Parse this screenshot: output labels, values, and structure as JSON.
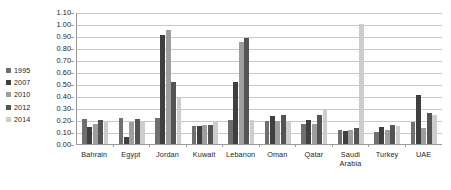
{
  "chart_data": {
    "type": "bar",
    "title": "",
    "subtitle": "",
    "xlabel": "",
    "ylabel": "",
    "ylim": [
      0.0,
      1.1
    ],
    "ytick_step": 0.1,
    "ytick_labels": [
      "1.10",
      "1.00",
      "0.90",
      "0.80",
      "0.70",
      "0.60",
      "0.50",
      "0.40",
      "0.30",
      "0.20",
      "0.10",
      "0.00"
    ],
    "ytick_values": [
      1.1,
      1.0,
      0.9,
      0.8,
      0.7,
      0.6,
      0.5,
      0.4,
      0.3,
      0.2,
      0.1,
      0.0
    ],
    "grid": true,
    "grid_axis": "y",
    "legend_position": "left",
    "categories": [
      "Bahrain",
      "Egypt",
      "Jordan",
      "Kuwait",
      "Lebanon",
      "Oman",
      "Qatar",
      "Saudi Arabia",
      "Turkey",
      "UAE"
    ],
    "series": [
      {
        "name": "1995",
        "color": "#6f6f6f",
        "values": [
          0.21,
          0.22,
          0.22,
          0.15,
          0.2,
          0.19,
          0.17,
          0.12,
          0.1,
          0.18
        ]
      },
      {
        "name": "2007",
        "color": "#3f3f3f",
        "values": [
          0.14,
          0.06,
          0.91,
          0.15,
          0.52,
          0.23,
          0.2,
          0.11,
          0.14,
          0.41
        ]
      },
      {
        "name": "2010",
        "color": "#9e9e9e",
        "values": [
          0.17,
          0.18,
          0.95,
          0.16,
          0.85,
          0.19,
          0.17,
          0.12,
          0.12,
          0.13
        ]
      },
      {
        "name": "2012",
        "color": "#545454",
        "values": [
          0.2,
          0.21,
          0.52,
          0.16,
          0.88,
          0.24,
          0.24,
          0.13,
          0.16,
          0.26
        ]
      },
      {
        "name": "2014",
        "color": "#cdcdcd",
        "values": [
          0.19,
          0.19,
          0.38,
          0.19,
          0.2,
          0.18,
          0.28,
          1.0,
          0.15,
          0.24
        ]
      }
    ]
  }
}
